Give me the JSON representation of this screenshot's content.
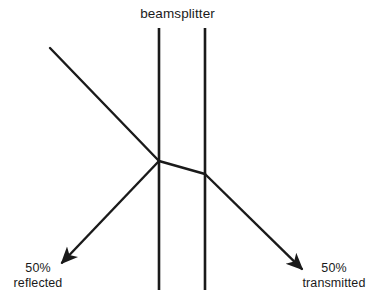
{
  "figure": {
    "kind": "optics-ray-diagram",
    "subject": "beamsplitter",
    "width": 373,
    "height": 308,
    "background_color": "#ffffff",
    "ink_color": "#1a1a1a"
  },
  "labels": {
    "beamsplitter": "beamsplitter",
    "reflected_percent": "50%",
    "reflected_word": "reflected",
    "transmitted_percent": "50%",
    "transmitted_word": "transmitted"
  },
  "geometry": {
    "beamsplitter_faces": [
      {
        "name": "front-face",
        "x": 159,
        "y_top": 28,
        "y_bottom": 290
      },
      {
        "name": "back-face",
        "x": 205,
        "y_top": 28,
        "y_bottom": 290
      }
    ],
    "rays": [
      {
        "name": "incident-ray",
        "from": [
          50,
          48
        ],
        "to": [
          159,
          161
        ],
        "arrow": false
      },
      {
        "name": "reflected-ray",
        "from": [
          159,
          161
        ],
        "to": [
          57,
          268
        ],
        "arrow": true
      },
      {
        "name": "internal-ray",
        "from": [
          159,
          161
        ],
        "to": [
          205,
          174
        ],
        "arrow": false
      },
      {
        "name": "transmitted-ray",
        "from": [
          205,
          174
        ],
        "to": [
          307,
          274
        ],
        "arrow": true
      }
    ],
    "split_point": [
      159,
      161
    ],
    "exit_point": [
      205,
      174
    ],
    "line_width": 2.6,
    "ray_width": 2.4
  }
}
